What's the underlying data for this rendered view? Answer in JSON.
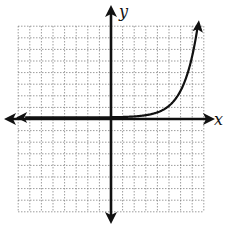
{
  "diagram": {
    "type": "coordinate-plane",
    "x_label": "x",
    "y_label": "y",
    "grid": {
      "style": "dotted",
      "x_range": [
        -8,
        8
      ],
      "y_range": [
        -8,
        8
      ],
      "step": 1,
      "color": "#777777"
    },
    "axes": {
      "color": "#111111",
      "arrows": "both-ends"
    },
    "curve": {
      "description": "exponential growth curve",
      "equation_estimate": "y = 2.3^(x - 5)",
      "horizontal_asymptote": "y = 0",
      "left_end_behavior": "approaches x-axis, arrow pointing left",
      "right_end_behavior": "increases rapidly, arrow pointing up",
      "color": "#111111"
    }
  },
  "chart_data": {
    "type": "line",
    "title": "",
    "xlabel": "x",
    "ylabel": "y",
    "xlim": [
      -8,
      8
    ],
    "ylim": [
      -8,
      8
    ],
    "grid": true,
    "series": [
      {
        "name": "f(x)",
        "x": [
          -8,
          -6,
          -4,
          -2,
          0,
          2,
          4,
          5,
          6,
          6.5,
          7,
          7.5
        ],
        "values": [
          0.0,
          0.0,
          0.0,
          0.0,
          0.02,
          0.08,
          0.43,
          1.0,
          2.3,
          3.5,
          5.3,
          8.0
        ]
      }
    ]
  }
}
